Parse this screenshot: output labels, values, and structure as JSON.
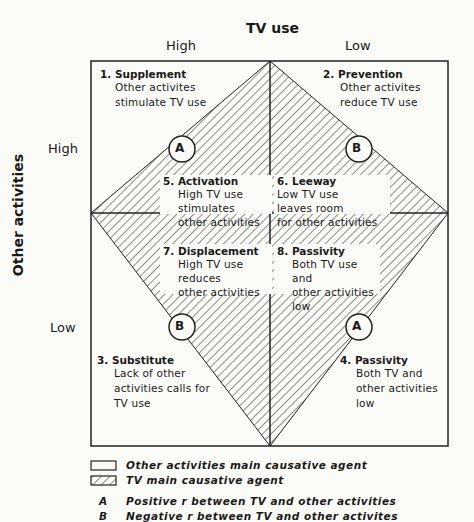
{
  "x_axis": {
    "title": "TV use",
    "high": "High",
    "low": "Low"
  },
  "y_axis": {
    "title": "Other activities",
    "high": "High",
    "low": "Low"
  },
  "quadrants": [
    {
      "num": "1.",
      "title": "Supplement",
      "lines": [
        "Other activites",
        "stimulate TV use"
      ]
    },
    {
      "num": "2.",
      "title": "Prevention",
      "lines": [
        "Other activites",
        "reduce TV use"
      ]
    },
    {
      "num": "3.",
      "title": "Substitute",
      "lines": [
        "Lack of other",
        "activities calls for",
        "TV use"
      ]
    },
    {
      "num": "4.",
      "title": "Passivity",
      "lines": [
        "Both TV and",
        "other activities",
        "low"
      ]
    },
    {
      "num": "5.",
      "title": "Activation",
      "lines": [
        "High TV use",
        "stimulates",
        "other activities"
      ]
    },
    {
      "num": "6.",
      "title": "Leeway",
      "lines": [
        "Low TV use",
        "leaves room",
        "for other activities"
      ]
    },
    {
      "num": "7.",
      "title": "Displacement",
      "lines": [
        "High TV use",
        "reduces",
        "other activities"
      ]
    },
    {
      "num": "8.",
      "title": "Passivity",
      "lines": [
        "Both TV use and",
        "other activities",
        "low"
      ]
    }
  ],
  "markers": {
    "top_left": "A",
    "top_right": "B",
    "bottom_left": "B",
    "bottom_right": "A"
  },
  "legend": {
    "open": "Other activities main causative agent",
    "hatched": "TV main causative agent",
    "a_key": "A",
    "a_text": "Positive r between TV and other activities",
    "b_key": "B",
    "b_text": "Negative r between TV and other activites"
  }
}
